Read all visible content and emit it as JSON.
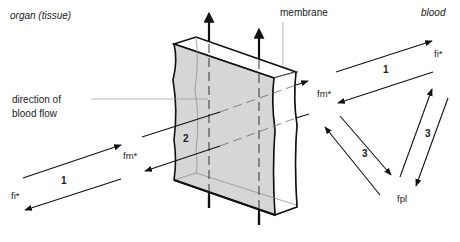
{
  "regions": {
    "left": "organ (tissue)",
    "right": "blood"
  },
  "labels": {
    "membrane": "membrane",
    "flow_line1": "direction of",
    "flow_line2": "blood flow",
    "fm_left": "fm*",
    "fi_left": "fi*",
    "fm_right": "fm*",
    "fi_right": "fi*",
    "fpl": "fpl"
  },
  "processes": {
    "p1_left": "1",
    "p2": "2",
    "p1_right": "1",
    "p3_left": "3",
    "p3_right": "3"
  },
  "colors": {
    "membrane_fill": "#d6d6d6",
    "membrane_side": "#ffffff",
    "stroke": "#111111",
    "thin_stroke": "#777777"
  }
}
